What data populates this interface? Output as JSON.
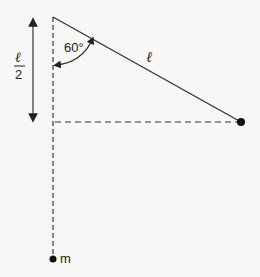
{
  "diagram": {
    "angle_label": "60°",
    "string_label": "ℓ",
    "half_length_label": {
      "numerator": "ℓ",
      "denominator": "2"
    },
    "mass_label": "m",
    "colors": {
      "line": "#333333",
      "background": "#f7f7f5"
    }
  }
}
